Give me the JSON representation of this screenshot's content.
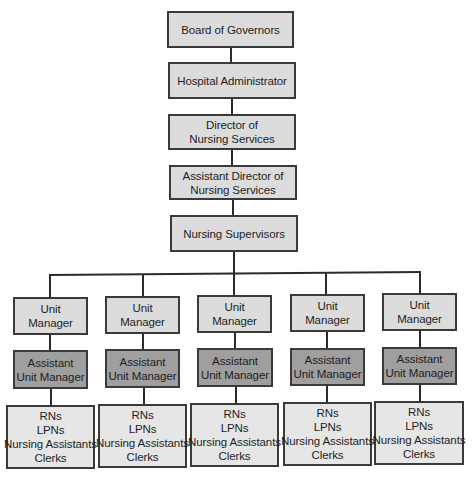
{
  "chart": {
    "hierarchy": [
      {
        "id": "board",
        "lines": [
          "Board of Governors"
        ]
      },
      {
        "id": "admin",
        "lines": [
          "Hospital Administrator"
        ]
      },
      {
        "id": "director",
        "lines": [
          "Director of",
          "Nursing Services"
        ]
      },
      {
        "id": "asst-director",
        "lines": [
          "Assistant Director of",
          "Nursing Services"
        ]
      },
      {
        "id": "supervisors",
        "lines": [
          "Nursing Supervisors"
        ]
      }
    ],
    "units": [
      {
        "manager": [
          "Unit",
          "Manager"
        ],
        "assistant": [
          "Assistant",
          "Unit Manager"
        ],
        "staff": [
          "RNs",
          "LPNs",
          "Nursing Assistants",
          "Clerks"
        ]
      },
      {
        "manager": [
          "Unit",
          "Manager"
        ],
        "assistant": [
          "Assistant",
          "Unit Manager"
        ],
        "staff": [
          "RNs",
          "LPNs",
          "Nursing Assistants",
          "Clerks"
        ]
      },
      {
        "manager": [
          "Unit",
          "Manager"
        ],
        "assistant": [
          "Assistant",
          "Unit Manager"
        ],
        "staff": [
          "RNs",
          "LPNs",
          "Nursing Assistants",
          "Clerks"
        ]
      },
      {
        "manager": [
          "Unit",
          "Manager"
        ],
        "assistant": [
          "Assistant",
          "Unit Manager"
        ],
        "staff": [
          "RNs",
          "LPNs",
          "Nursing Assistants",
          "Clerks"
        ]
      },
      {
        "manager": [
          "Unit",
          "Manager"
        ],
        "assistant": [
          "Assistant",
          "Unit Manager"
        ],
        "staff": [
          "RNs",
          "LPNs",
          "Nursing Assistants",
          "Clerks"
        ]
      }
    ],
    "colors": {
      "box_fill": "#dcdcdc",
      "assistant_fill": "#9f9f9f",
      "staff_fill": "#e6e6e6",
      "border": "#3a3a3a",
      "connector": "#2a2a2a"
    }
  }
}
